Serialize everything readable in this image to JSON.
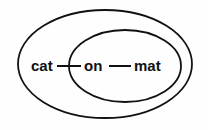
{
  "diagram": {
    "outer_set": {
      "shape": "ellipse"
    },
    "inner_set": {
      "shape": "ellipse"
    },
    "nodes": [
      {
        "label": "cat"
      },
      {
        "label": "on"
      },
      {
        "label": "mat"
      }
    ],
    "edges": [
      {
        "from": "cat",
        "to": "on"
      },
      {
        "from": "on",
        "to": "mat"
      }
    ],
    "stroke_color": "#111111"
  }
}
